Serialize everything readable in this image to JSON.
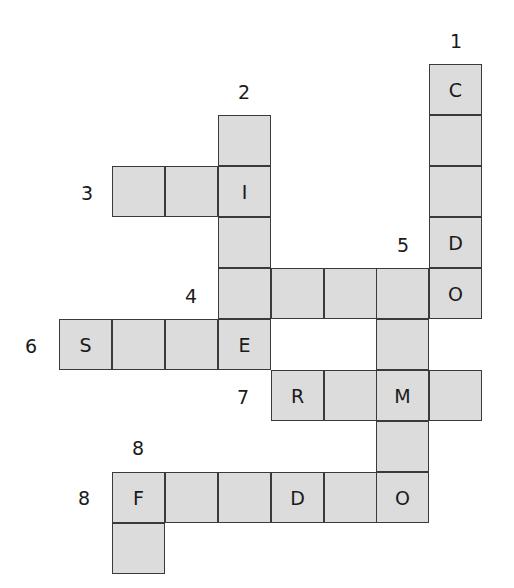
{
  "puzzle": {
    "type": "crossword",
    "origin": {
      "x": 59,
      "y": 64
    },
    "col_step": 52.9,
    "row_step": 51.0,
    "colors": {
      "cell_fill": "#dcdcdc",
      "cell_border": "#3a3a3a",
      "text": "#1a1a1a",
      "background": "#ffffff"
    },
    "cells": [
      {
        "r": 0,
        "c": 7,
        "letter": "C"
      },
      {
        "r": 1,
        "c": 7,
        "letter": ""
      },
      {
        "r": 2,
        "c": 7,
        "letter": ""
      },
      {
        "r": 3,
        "c": 7,
        "letter": "D"
      },
      {
        "r": 4,
        "c": 7,
        "letter": "O"
      },
      {
        "r": 1,
        "c": 3,
        "letter": ""
      },
      {
        "r": 2,
        "c": 3,
        "letter": "I"
      },
      {
        "r": 3,
        "c": 3,
        "letter": ""
      },
      {
        "r": 4,
        "c": 3,
        "letter": ""
      },
      {
        "r": 5,
        "c": 3,
        "letter": "E"
      },
      {
        "r": 2,
        "c": 1,
        "letter": ""
      },
      {
        "r": 2,
        "c": 2,
        "letter": ""
      },
      {
        "r": 4,
        "c": 4,
        "letter": ""
      },
      {
        "r": 4,
        "c": 5,
        "letter": ""
      },
      {
        "r": 4,
        "c": 6,
        "letter": ""
      },
      {
        "r": 5,
        "c": 6,
        "letter": ""
      },
      {
        "r": 6,
        "c": 6,
        "letter": "M"
      },
      {
        "r": 7,
        "c": 6,
        "letter": ""
      },
      {
        "r": 8,
        "c": 6,
        "letter": "O"
      },
      {
        "r": 5,
        "c": 0,
        "letter": "S"
      },
      {
        "r": 5,
        "c": 1,
        "letter": ""
      },
      {
        "r": 5,
        "c": 2,
        "letter": ""
      },
      {
        "r": 6,
        "c": 4,
        "letter": "R"
      },
      {
        "r": 6,
        "c": 5,
        "letter": ""
      },
      {
        "r": 6,
        "c": 7,
        "letter": ""
      },
      {
        "r": 8,
        "c": 1,
        "letter": "F"
      },
      {
        "r": 8,
        "c": 2,
        "letter": ""
      },
      {
        "r": 8,
        "c": 3,
        "letter": ""
      },
      {
        "r": 8,
        "c": 4,
        "letter": "D"
      },
      {
        "r": 8,
        "c": 5,
        "letter": ""
      },
      {
        "r": 9,
        "c": 1,
        "letter": ""
      }
    ],
    "clue_numbers": [
      {
        "label": "1",
        "x": 456,
        "y": 30
      },
      {
        "label": "2",
        "x": 244,
        "y": 81
      },
      {
        "label": "3",
        "x": 87,
        "y": 182
      },
      {
        "label": "4",
        "x": 191,
        "y": 285
      },
      {
        "label": "5",
        "x": 403,
        "y": 234
      },
      {
        "label": "6",
        "x": 31,
        "y": 335
      },
      {
        "label": "7",
        "x": 243,
        "y": 386
      },
      {
        "label": "8",
        "x": 138,
        "y": 437
      },
      {
        "label": "8",
        "x": 84,
        "y": 487
      }
    ],
    "words": [
      {
        "number": "1",
        "direction": "down",
        "row": 0,
        "col": 7,
        "length": 5,
        "pattern": "C__DO"
      },
      {
        "number": "2",
        "direction": "down",
        "row": 1,
        "col": 3,
        "length": 5,
        "pattern": "_I__E"
      },
      {
        "number": "3",
        "direction": "across",
        "row": 2,
        "col": 1,
        "length": 3,
        "pattern": "__I"
      },
      {
        "number": "4",
        "direction": "across",
        "row": 4,
        "col": 3,
        "length": 5,
        "pattern": "____O"
      },
      {
        "number": "5",
        "direction": "down",
        "row": 4,
        "col": 6,
        "length": 5,
        "pattern": "__M_O"
      },
      {
        "number": "6",
        "direction": "across",
        "row": 5,
        "col": 0,
        "length": 4,
        "pattern": "S__E"
      },
      {
        "number": "7",
        "direction": "across",
        "row": 6,
        "col": 4,
        "length": 4,
        "pattern": "R_M_"
      },
      {
        "number": "8",
        "direction": "across",
        "row": 8,
        "col": 1,
        "length": 6,
        "pattern": "F__D_O"
      },
      {
        "number": "8",
        "direction": "down",
        "row": 8,
        "col": 1,
        "length": 2,
        "pattern": "F_"
      }
    ]
  }
}
